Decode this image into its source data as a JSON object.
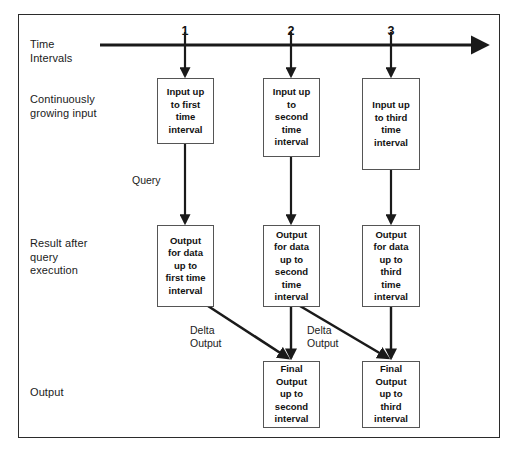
{
  "diagram": {
    "title_row_labels": [
      {
        "id": "time-intervals",
        "text": "Time\nIntervals"
      },
      {
        "id": "continuously-growing-input",
        "text": "Continuously\ngrowing input"
      },
      {
        "id": "result-after-query-execution",
        "text": "Result after\nquery\nexecution"
      },
      {
        "id": "output",
        "text": "Output"
      }
    ],
    "timeline": {
      "ticks": [
        "1",
        "2",
        "3"
      ]
    },
    "input_nodes": [
      {
        "id": "input-node-1",
        "text": "Input up\nto first\ntime\ninterval"
      },
      {
        "id": "input-node-2",
        "text": "Input up\nto\nsecond\ntime\ninterval"
      },
      {
        "id": "input-node-3",
        "text": "Input up\nto third\ntime\ninterval"
      }
    ],
    "result_nodes": [
      {
        "id": "result-node-1",
        "text": "Output\nfor data\nup to\nfirst time\ninterval"
      },
      {
        "id": "result-node-2",
        "text": "Output\nfor data\nup to\nsecond\ntime\ninterval"
      },
      {
        "id": "result-node-3",
        "text": "Output\nfor data\nup to\nthird\ntime\ninterval"
      }
    ],
    "final_nodes": [
      {
        "id": "final-node-2",
        "text": "Final\nOutput\nup to\nsecond\ninterval"
      },
      {
        "id": "final-node-3",
        "text": "Final\nOutput\nup to\nthird\ninterval"
      }
    ],
    "edge_labels": [
      {
        "id": "query-label",
        "text": "Query"
      },
      {
        "id": "delta-output-label-1",
        "text": "Delta\nOutput"
      },
      {
        "id": "delta-output-label-2",
        "text": "Delta\nOutput"
      }
    ],
    "colors": {
      "line": "#1a1a1a",
      "box_border": "#555555",
      "frame_border": "#2b2b2b",
      "background": "#ffffff",
      "text": "#111111"
    }
  }
}
